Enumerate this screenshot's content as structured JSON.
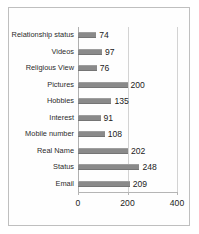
{
  "chart_data": {
    "type": "bar",
    "orientation": "horizontal",
    "title": "",
    "xlabel": "",
    "ylabel": "",
    "categories": [
      "Relationship status",
      "Videos",
      "Religious View",
      "Pictures",
      "Hobbies",
      "Interest",
      "Mobile number",
      "Real Name",
      "Status",
      "Email"
    ],
    "values": [
      74,
      97,
      76,
      200,
      135,
      91,
      108,
      202,
      248,
      209
    ],
    "xlim": [
      0,
      400
    ],
    "xticks": [
      0,
      200,
      400
    ],
    "xtick_labels": [
      "0",
      "200",
      "400"
    ],
    "grid": true,
    "legend": false,
    "bar_color": "#8a8a8a",
    "frame_color": "#bfbfbf",
    "gridline_color": "#d3d3d3",
    "text_color": "#222222"
  }
}
